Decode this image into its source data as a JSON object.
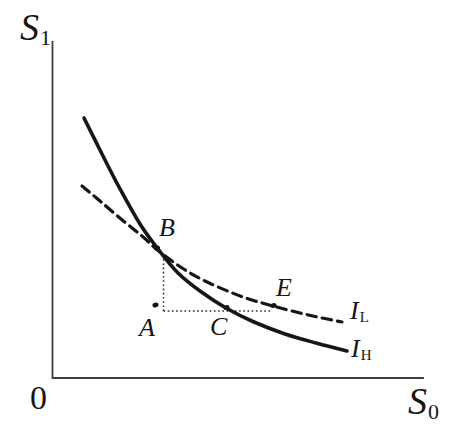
{
  "colors": {
    "background": "#ffffff",
    "ink": "#161616",
    "axis": "#3f3f3f",
    "guide": "#2a2a2a"
  },
  "labels": {
    "y_axis": {
      "main": "S",
      "sub": "1"
    },
    "x_axis": {
      "main": "S",
      "sub": "0"
    },
    "origin": "0",
    "points": {
      "A": "A",
      "B": "B",
      "C": "C",
      "E": "E"
    },
    "curve_high": {
      "main": "I",
      "sub": "H"
    },
    "curve_low": {
      "main": "I",
      "sub": "L"
    }
  },
  "geometry": {
    "axes": {
      "x0": 52.5,
      "y_top": 42,
      "y_bottom": 378,
      "x_right": 423
    },
    "curves": [
      {
        "name": "indifference-curve-IL-dashed",
        "style": "dashed",
        "dash": "9.5 6",
        "width": 3.2,
        "points": [
          [
            82,
            186
          ],
          [
            100,
            201
          ],
          [
            121,
            219
          ],
          [
            142,
            236
          ],
          [
            160,
            252
          ],
          [
            182,
            268
          ],
          [
            205,
            281
          ],
          [
            230,
            292
          ],
          [
            252,
            300
          ],
          [
            273,
            306
          ],
          [
            300,
            313
          ],
          [
            322,
            318
          ],
          [
            342,
            322
          ]
        ]
      },
      {
        "name": "indifference-curve-IH-solid",
        "style": "solid",
        "width": 3.6,
        "points": [
          [
            84,
            118
          ],
          [
            100,
            150
          ],
          [
            119,
            187
          ],
          [
            140,
            224
          ],
          [
            158,
            249
          ],
          [
            178,
            273
          ],
          [
            200,
            291
          ],
          [
            226,
            308
          ],
          [
            254,
            322
          ],
          [
            285,
            334
          ],
          [
            316,
            343
          ],
          [
            347,
            351
          ]
        ]
      }
    ],
    "guides": [
      {
        "name": "guide-dotted-B-to-A",
        "d": "M 163.5 255 L 163.5 311"
      },
      {
        "name": "guide-dotted-A-to-E",
        "d": "M 163.5 311 L 272 311"
      }
    ],
    "markers": [
      {
        "name": "point-dot-A",
        "x": 155.5,
        "y": 305
      },
      {
        "name": "point-dot-B",
        "x": 157,
        "y": 248
      },
      {
        "name": "point-dot-C",
        "x": 226.5,
        "y": 307.5
      },
      {
        "name": "point-dot-E",
        "x": 273.5,
        "y": 305.5
      }
    ]
  }
}
